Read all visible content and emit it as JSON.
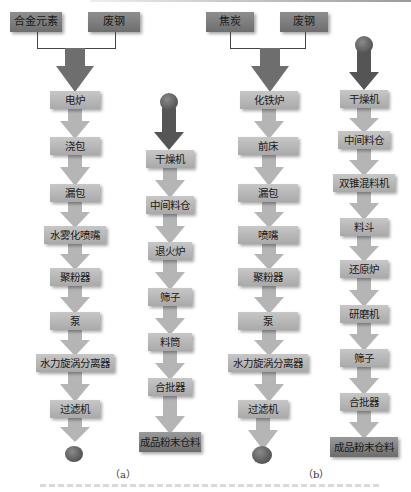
{
  "colors": {
    "source_box": "#7e7e7e",
    "process_box": "#b8b8b8",
    "final_box": "#838383",
    "light_arrow": "#b5b5b5",
    "dark_arrow": "#555555",
    "ball": "#555555"
  },
  "diagram_a": {
    "label": "（a）",
    "left_chain": {
      "sources": [
        "合金元素",
        "废钢"
      ],
      "steps": [
        "电炉",
        "浇包",
        "漏包",
        "水雾化喷嘴",
        "聚粉器",
        "泵",
        "水力旋涡分离器",
        "过滤机"
      ],
      "end": "ball"
    },
    "right_chain": {
      "start": "ball",
      "steps": [
        "干燥机",
        "中间料仓",
        "退火炉",
        "筛子",
        "料筒",
        "合批器"
      ],
      "final": "成品粉末仓料"
    }
  },
  "diagram_b": {
    "label": "（b）",
    "left_chain": {
      "sources": [
        "焦炭",
        "废钢"
      ],
      "steps": [
        "化铁炉",
        "前床",
        "漏包",
        "喷嘴",
        "聚粉器",
        "泵",
        "水力旋涡分离器",
        "过滤机"
      ],
      "end": "ball"
    },
    "right_chain": {
      "start": "ball",
      "steps": [
        "干燥机",
        "中间料仓",
        "双锥混料机",
        "料斗",
        "还原炉",
        "研磨机",
        "筛子",
        "合批器"
      ],
      "final": "成品粉末仓料"
    }
  }
}
